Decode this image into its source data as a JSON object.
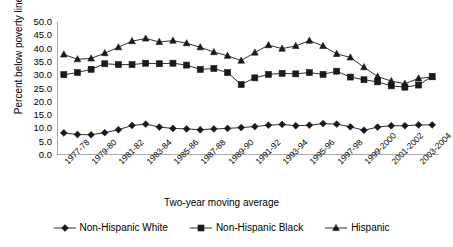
{
  "chart_data": {
    "type": "line",
    "title": "",
    "xlabel": "Two-year moving average",
    "ylabel": "Percent below poverty line",
    "ylim": [
      0.0,
      50.0
    ],
    "ytick_step": 5.0,
    "ytick_labels": [
      "50.0",
      "45.0",
      "40.0",
      "35.0",
      "30.0",
      "25.0",
      "20.0",
      "15.0",
      "10.0",
      "5.0",
      "0.0"
    ],
    "grid": false,
    "legend_position": "bottom",
    "categories": [
      "1977-78",
      "1978-79",
      "1979-80",
      "1980-81",
      "1981-82",
      "1982-83",
      "1983-84",
      "1984-85",
      "1985-86",
      "1986-87",
      "1987-88",
      "1988-89",
      "1989-90",
      "1990-91",
      "1991-92",
      "1992-93",
      "1993-94",
      "1994-95",
      "1995-96",
      "1996-97",
      "1997-98",
      "1998-99",
      "1999-2000",
      "2000-2001",
      "2001-2002",
      "2002-2003",
      "2003-2004",
      "2004-2005"
    ],
    "xtick_labels_shown": [
      "1977-78",
      "1979-80",
      "1981-82",
      "1983-84",
      "1985-86",
      "1987-88",
      "1989-90",
      "1991-92",
      "1993-94",
      "1995-96",
      "1997-98",
      "1999-2000",
      "2001-2002",
      "2003-2004"
    ],
    "series": [
      {
        "name": "Non-Hispanic White",
        "marker": "diamond",
        "color": "#1a1a1a",
        "values": [
          8.3,
          7.7,
          7.6,
          8.4,
          9.5,
          11.1,
          11.6,
          10.5,
          10.0,
          9.8,
          9.5,
          9.8,
          10.0,
          10.3,
          10.7,
          11.2,
          11.5,
          11.0,
          11.2,
          11.8,
          11.6,
          10.6,
          9.3,
          10.5,
          11.0,
          11.0,
          11.3,
          11.3
        ]
      },
      {
        "name": "Non-Hispanic Black",
        "marker": "square",
        "color": "#1a1a1a",
        "values": [
          30.2,
          31.0,
          32.2,
          34.3,
          34.0,
          34.0,
          34.5,
          34.3,
          34.5,
          33.8,
          32.2,
          32.5,
          31.0,
          26.5,
          29.0,
          30.3,
          30.7,
          30.5,
          31.0,
          30.3,
          31.5,
          29.3,
          28.3,
          27.5,
          26.0,
          25.5,
          26.3,
          29.6
        ]
      },
      {
        "name": "Hispanic",
        "marker": "triangle",
        "color": "#1a1a1a",
        "values": [
          37.8,
          36.0,
          36.3,
          38.3,
          40.5,
          42.8,
          43.8,
          42.5,
          43.0,
          42.0,
          40.5,
          38.7,
          37.3,
          35.5,
          38.5,
          41.3,
          40.0,
          41.0,
          43.0,
          41.0,
          38.0,
          36.7,
          33.0,
          29.5,
          27.8,
          26.8,
          28.8,
          29.3
        ]
      }
    ]
  },
  "legend": {
    "items": [
      {
        "label": "Non-Hispanic White",
        "marker": "diamond"
      },
      {
        "label": "Non-Hispanic Black",
        "marker": "square"
      },
      {
        "label": "Hispanic",
        "marker": "triangle"
      }
    ]
  }
}
